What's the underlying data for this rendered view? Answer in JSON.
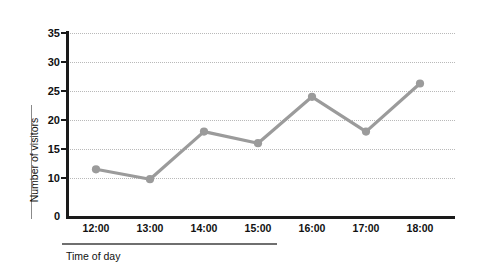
{
  "chart_data": {
    "type": "line",
    "title": "",
    "xlabel": "Time of day",
    "ylabel": "Number of visitors",
    "categories": [
      "12:00",
      "13:00",
      "14:00",
      "15:00",
      "16:00",
      "17:00",
      "18:00"
    ],
    "values": [
      11.5,
      9.7,
      18,
      16,
      24,
      18,
      26.3
    ],
    "series": [
      {
        "name": "Number of visitors",
        "values": [
          11.5,
          9.7,
          18,
          16,
          24,
          18,
          26.3
        ]
      }
    ],
    "y_ticks": [
      0,
      10,
      15,
      20,
      25,
      30,
      35
    ],
    "ylim": [
      0,
      35
    ],
    "y_axis_broken": true,
    "grid": true,
    "grid_style": "dotted",
    "legend": "none",
    "line_color": "#9b9b9b",
    "marker": "circle",
    "marker_color": "#9b9b9b",
    "axis_color": "#1a1a1a",
    "grid_color": "#b9b9b9",
    "background": "#ffffff"
  },
  "axes": {
    "y_title": "Number of visitors",
    "x_title": "Time of day",
    "y_tick_labels": [
      "35",
      "30",
      "25",
      "20",
      "15",
      "10",
      "0"
    ],
    "x_tick_labels": [
      "12:00",
      "13:00",
      "14:00",
      "15:00",
      "16:00",
      "17:00",
      "18:00"
    ]
  }
}
